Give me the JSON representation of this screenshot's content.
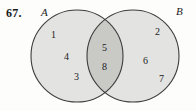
{
  "exercise": {
    "number": "67."
  },
  "diagram": {
    "type": "venn-two-set",
    "set_a_label": "A",
    "set_b_label": "B",
    "fill_color": "#e2e2e0",
    "intersection_color": "#c9c9c6",
    "stroke_color": "#3a3a3a",
    "background_color": "#fdfdfc",
    "regions": {
      "a_only": {
        "name": "A only",
        "elements": [
          "1",
          "4",
          "3"
        ],
        "positions": [
          {
            "x": 51,
            "y": 30
          },
          {
            "x": 64,
            "y": 52
          },
          {
            "x": 74,
            "y": 72
          }
        ]
      },
      "intersection": {
        "name": "A and B",
        "elements": [
          "5",
          "8"
        ],
        "positions": [
          {
            "x": 102,
            "y": 43
          },
          {
            "x": 102,
            "y": 62
          }
        ]
      },
      "b_only": {
        "name": "B only",
        "elements": [
          "2",
          "6",
          "7"
        ],
        "positions": [
          {
            "x": 155,
            "y": 27
          },
          {
            "x": 143,
            "y": 56
          },
          {
            "x": 159,
            "y": 74
          }
        ]
      }
    },
    "circle_a": {
      "cx": 77,
      "cy": 56,
      "r": 46
    },
    "circle_b": {
      "cx": 133,
      "cy": 56,
      "r": 46
    }
  }
}
